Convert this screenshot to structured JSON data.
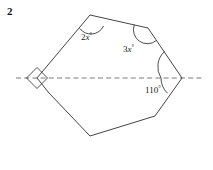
{
  "page": {
    "problem_number": "2",
    "background_color": "#ffffff",
    "stroke_color": "#3a3a3a",
    "dash_color": "#6b6b6b",
    "text_color": "#1a1a1a"
  },
  "figure": {
    "type": "polygon-angle-diagram",
    "polygon": {
      "name": "heptagon",
      "vertices": [
        {
          "name": "left-vertex",
          "x": 37,
          "y": 78
        },
        {
          "name": "top-left-vertex",
          "x": 90,
          "y": 15
        },
        {
          "name": "top-right-vertex",
          "x": 148,
          "y": 28
        },
        {
          "name": "right-vertex",
          "x": 182,
          "y": 78
        },
        {
          "name": "bottom-right-vertex",
          "x": 155,
          "y": 116
        },
        {
          "name": "bottom-vertex",
          "x": 90,
          "y": 136
        },
        {
          "name": "bottom-left-vertex",
          "x": 49,
          "y": 93
        }
      ]
    },
    "dashed_line": {
      "name": "line-of-symmetry",
      "x1": 16,
      "y1": 78,
      "x2": 204,
      "y2": 78,
      "style": "dashed"
    },
    "angle_marks": [
      {
        "name": "right-angle-mark-left-vertex",
        "at_vertex": "left-vertex",
        "mark": "square",
        "label": ""
      },
      {
        "name": "angle-arc-top-left-vertex",
        "at_vertex": "top-left-vertex",
        "mark": "arc",
        "label": "2x",
        "label_suffix": "°",
        "label_x": 81,
        "label_y": 40
      },
      {
        "name": "angle-arc-top-right-vertex",
        "at_vertex": "top-right-vertex",
        "mark": "arc",
        "label": "3x",
        "label_suffix": "°",
        "label_x": 123,
        "label_y": 52
      },
      {
        "name": "angle-arc-right-vertex-upper",
        "at_vertex": "right-vertex",
        "mark": "arc",
        "label": ""
      },
      {
        "name": "angle-arc-right-vertex-lower",
        "at_vertex": "right-vertex",
        "mark": "arc",
        "label": "110",
        "label_suffix": "°",
        "label_x": 145,
        "label_y": 93
      }
    ]
  }
}
